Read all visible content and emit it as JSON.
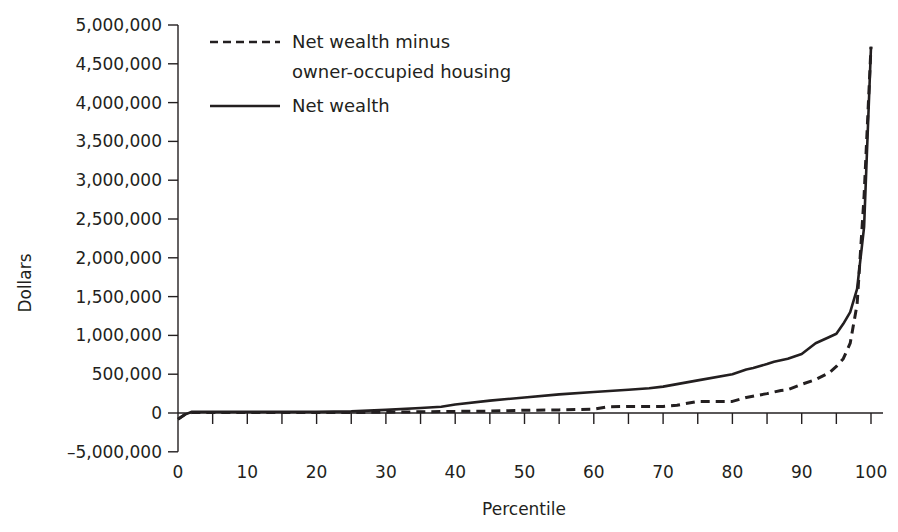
{
  "chart_data": {
    "type": "line",
    "title": "",
    "xlabel": "Percentile",
    "ylabel": "Dollars",
    "xlim": [
      0,
      100
    ],
    "ylim": [
      -500000,
      5000000
    ],
    "grid": false,
    "legend_position": "upper-left (inside plot)",
    "x_ticks": [
      0,
      10,
      20,
      30,
      40,
      50,
      60,
      70,
      80,
      90,
      100
    ],
    "x_minor_tick_step": 5,
    "y_ticks": [
      {
        "value": 5000000,
        "label": "5,000,000"
      },
      {
        "value": 4500000,
        "label": "4,500,000"
      },
      {
        "value": 4000000,
        "label": "4,000,000"
      },
      {
        "value": 3500000,
        "label": "3,500,000"
      },
      {
        "value": 3000000,
        "label": "3,000,000"
      },
      {
        "value": 2500000,
        "label": "2,500,000"
      },
      {
        "value": 2000000,
        "label": "2,000,000"
      },
      {
        "value": 1500000,
        "label": "1,500,000"
      },
      {
        "value": 1000000,
        "label": "1,000,000"
      },
      {
        "value": 500000,
        "label": "500,000"
      },
      {
        "value": 0,
        "label": "0"
      },
      {
        "value": -500000,
        "label": "–5,000,000"
      }
    ],
    "series": [
      {
        "name": "Net wealth minus owner-occupied housing",
        "legend_lines": [
          "Net wealth minus",
          "owner-occupied housing"
        ],
        "style": "dashed",
        "color": "#231f20",
        "x": [
          0,
          1,
          2,
          5,
          10,
          15,
          20,
          25,
          30,
          35,
          40,
          45,
          50,
          55,
          60,
          62,
          65,
          68,
          70,
          72,
          75,
          78,
          80,
          82,
          85,
          87,
          88,
          90,
          92,
          94,
          95,
          96,
          97,
          98,
          99,
          100
        ],
        "values": [
          -80000,
          -20000,
          5000,
          5000,
          5000,
          5000,
          5000,
          5000,
          10000,
          15000,
          20000,
          25000,
          35000,
          40000,
          50000,
          80000,
          85000,
          85000,
          85000,
          100000,
          150000,
          150000,
          150000,
          200000,
          250000,
          290000,
          300000,
          370000,
          430000,
          520000,
          600000,
          700000,
          900000,
          1400000,
          2800000,
          4720000
        ]
      },
      {
        "name": "Net wealth",
        "legend_lines": [
          "Net wealth"
        ],
        "style": "solid",
        "color": "#231f20",
        "x": [
          0,
          1,
          2,
          5,
          10,
          15,
          20,
          25,
          30,
          35,
          38,
          40,
          45,
          50,
          55,
          60,
          65,
          68,
          70,
          75,
          80,
          82,
          83,
          85,
          86,
          88,
          90,
          92,
          94,
          95,
          96,
          97,
          98,
          99,
          100
        ],
        "values": [
          -80000,
          -20000,
          15000,
          15000,
          15000,
          15000,
          15000,
          20000,
          40000,
          65000,
          80000,
          110000,
          160000,
          200000,
          240000,
          270000,
          300000,
          320000,
          340000,
          420000,
          500000,
          560000,
          580000,
          630000,
          660000,
          700000,
          760000,
          900000,
          980000,
          1020000,
          1150000,
          1300000,
          1600000,
          2400000,
          4720000
        ]
      }
    ]
  }
}
